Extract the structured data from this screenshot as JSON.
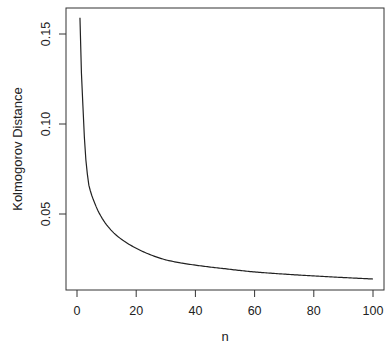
{
  "chart_data": {
    "type": "line",
    "title": "",
    "xlabel": "n",
    "ylabel": "Kolmogorov Distance",
    "xlim": [
      -3,
      104
    ],
    "ylim": [
      0.0078,
      0.1644
    ],
    "x_ticks": [
      0,
      20,
      40,
      60,
      80,
      100
    ],
    "x_tick_labels": [
      "0",
      "20",
      "40",
      "60",
      "80",
      "100"
    ],
    "y_ticks": [
      0.05,
      0.1,
      0.15
    ],
    "y_tick_labels": [
      "0.05",
      "0.10",
      "0.15"
    ],
    "grid": false,
    "legend": null,
    "series": [
      {
        "name": "Kolmogorov Distance",
        "color": "#222222",
        "x": [
          1,
          2,
          3,
          4,
          6,
          8,
          10,
          15,
          20,
          30,
          35,
          40,
          50,
          60,
          70,
          80,
          90,
          100
        ],
        "values": [
          0.159,
          0.11,
          0.08,
          0.066,
          0.056,
          0.049,
          0.044,
          0.036,
          0.031,
          0.0245,
          0.0228,
          0.0216,
          0.0196,
          0.0178,
          0.0166,
          0.0156,
          0.0147,
          0.0139
        ]
      }
    ]
  },
  "axes": {
    "x_title": "n",
    "y_title": "Kolmogorov Distance"
  }
}
